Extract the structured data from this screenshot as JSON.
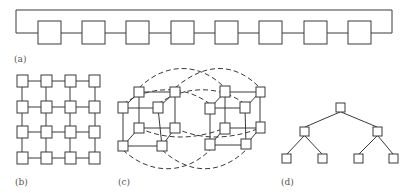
{
  "figure": {
    "panels": [
      {
        "id": "a",
        "label": "(a)",
        "topology": "ring",
        "node_count": 8
      },
      {
        "id": "b",
        "label": "(b)",
        "topology": "2D mesh",
        "rows": 4,
        "cols": 4
      },
      {
        "id": "c",
        "label": "(c)",
        "topology": "hypercube (4D, two 3D cubes linked)",
        "node_count": 16
      },
      {
        "id": "d",
        "label": "(d)",
        "topology": "binary tree",
        "levels": 3,
        "node_count": 7
      }
    ],
    "colors": {
      "line": "#3a3a3a",
      "node_fill": "#ffffff",
      "label": "#555555",
      "background": "#ffffff"
    }
  }
}
